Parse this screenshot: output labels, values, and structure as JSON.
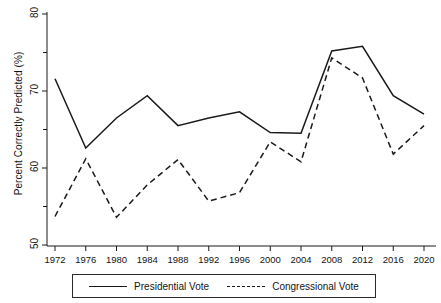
{
  "chart_data": {
    "type": "line",
    "title": "",
    "xlabel": "",
    "ylabel": "Percent Correctly Predicted (%)",
    "categories": [
      "1972",
      "1976",
      "1980",
      "1984",
      "1988",
      "1992",
      "1996",
      "2000",
      "2004",
      "2008",
      "2012",
      "2016",
      "2020"
    ],
    "x": [
      1972,
      1976,
      1980,
      1984,
      1988,
      1992,
      1996,
      2000,
      2004,
      2008,
      2012,
      2016,
      2020
    ],
    "xlim": [
      1972,
      2020
    ],
    "ylim": [
      50,
      80
    ],
    "yticks": [
      50,
      60,
      70,
      80
    ],
    "yticklabels": [
      "50",
      "60",
      "70",
      "80"
    ],
    "grid": false,
    "legend_position": "bottom",
    "series": [
      {
        "name": "Presidential Vote",
        "style": "solid",
        "color": "#1a1a1a",
        "values": [
          71.6,
          62.6,
          66.5,
          69.4,
          65.5,
          66.5,
          67.3,
          64.6,
          64.5,
          75.2,
          75.8,
          69.4,
          67.0
        ]
      },
      {
        "name": "Congressional Vote",
        "style": "dashed",
        "color": "#1a1a1a",
        "values": [
          53.7,
          61.2,
          53.6,
          57.8,
          61.1,
          55.7,
          56.8,
          63.4,
          60.8,
          74.3,
          71.7,
          61.8,
          65.5
        ]
      }
    ]
  },
  "legend": {
    "entries": [
      {
        "label": "Presidential Vote",
        "style": "solid"
      },
      {
        "label": "Congressional Vote",
        "style": "dashed"
      }
    ]
  }
}
